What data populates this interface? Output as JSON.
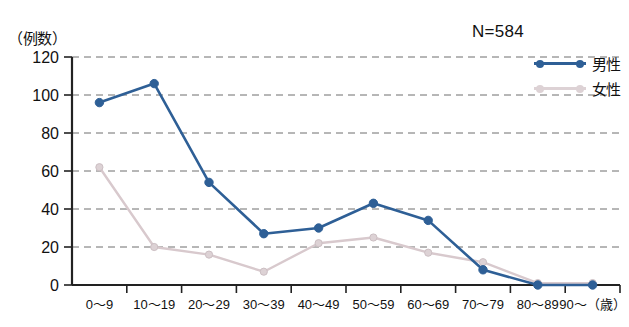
{
  "chart_data": {
    "type": "line",
    "title": "",
    "ylabel": "（例数）",
    "xlabel": "（歳）",
    "annotation": "N=584",
    "ylim": [
      0,
      120
    ],
    "yticks": [
      0,
      20,
      40,
      60,
      80,
      100,
      120
    ],
    "ytick_labels": [
      "0",
      "20",
      "40",
      "60",
      "80",
      "100",
      "120"
    ],
    "grid": true,
    "legend_position": "top-right",
    "categories": [
      "0〜9",
      "10〜19",
      "20〜29",
      "30〜39",
      "40〜49",
      "50〜59",
      "60〜69",
      "70〜79",
      "80〜89",
      "90〜"
    ],
    "xtick_labels": [
      "0〜9",
      "10〜19",
      "20〜29",
      "30〜39",
      "40〜49",
      "50〜59",
      "60〜69",
      "70〜79",
      "80〜89",
      "90〜（歳）"
    ],
    "series": [
      {
        "name": "男性",
        "color": "#2e5f96",
        "marker": "circle",
        "values": [
          96,
          106,
          54,
          27,
          30,
          43,
          34,
          8,
          0,
          0
        ]
      },
      {
        "name": "女性",
        "color": "#ddd2d5",
        "marker": "circle",
        "values": [
          62,
          20,
          16,
          7,
          22,
          25,
          17,
          12,
          1,
          1
        ]
      }
    ]
  },
  "legend": {
    "items": [
      {
        "label": "男性",
        "color": "#2e5f96"
      },
      {
        "label": "女性",
        "color": "#ddd2d5"
      }
    ]
  }
}
